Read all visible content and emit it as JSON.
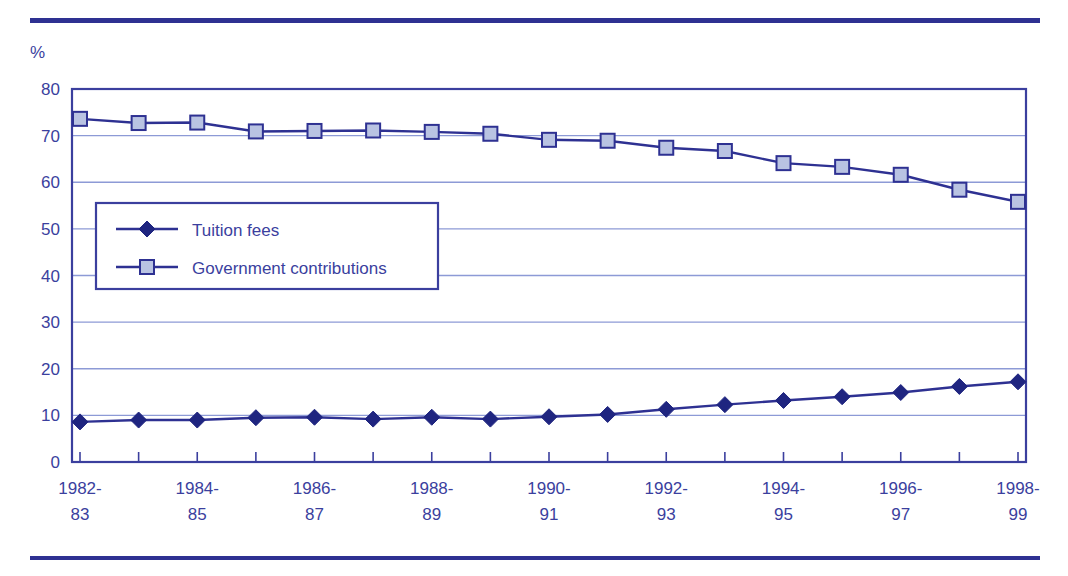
{
  "figure": {
    "y_axis_unit_label": "%",
    "colors": {
      "line": "#2e3192",
      "text": "#3b3f9e",
      "gridline": "#8d9ad6",
      "frame": "#3b3f9e",
      "rule": "#2e3192",
      "marker_square_fill": "#b9c3e2",
      "marker_diamond_fill": "#1f2580",
      "background": "#ffffff"
    }
  },
  "chart_data": {
    "type": "line",
    "title": "",
    "xlabel": "",
    "ylabel": "%",
    "ylim": [
      0,
      80
    ],
    "yticks": [
      0,
      10,
      20,
      30,
      40,
      50,
      60,
      70,
      80
    ],
    "grid": true,
    "legend_position": "inside-left",
    "categories": [
      "1982-83",
      "1983-84",
      "1984-85",
      "1985-86",
      "1986-87",
      "1987-88",
      "1988-89",
      "1989-90",
      "1990-91",
      "1991-92",
      "1992-93",
      "1993-94",
      "1994-95",
      "1995-96",
      "1996-97",
      "1997-98",
      "1998-99"
    ],
    "xtick_labels": [
      {
        "line1": "1982-",
        "line2": "83"
      },
      {
        "line1": "",
        "line2": ""
      },
      {
        "line1": "1984-",
        "line2": "85"
      },
      {
        "line1": "",
        "line2": ""
      },
      {
        "line1": "1986-",
        "line2": "87"
      },
      {
        "line1": "",
        "line2": ""
      },
      {
        "line1": "1988-",
        "line2": "89"
      },
      {
        "line1": "",
        "line2": ""
      },
      {
        "line1": "1990-",
        "line2": "91"
      },
      {
        "line1": "",
        "line2": ""
      },
      {
        "line1": "1992-",
        "line2": "93"
      },
      {
        "line1": "",
        "line2": ""
      },
      {
        "line1": "1994-",
        "line2": "95"
      },
      {
        "line1": "",
        "line2": ""
      },
      {
        "line1": "1996-",
        "line2": "97"
      },
      {
        "line1": "",
        "line2": ""
      },
      {
        "line1": "1998-",
        "line2": "99"
      }
    ],
    "series": [
      {
        "name": "Tuition fees",
        "marker": "diamond",
        "values": [
          8.6,
          9.0,
          9.0,
          9.5,
          9.6,
          9.2,
          9.6,
          9.2,
          9.7,
          10.2,
          11.3,
          12.3,
          13.2,
          14.0,
          14.9,
          16.2,
          17.2
        ]
      },
      {
        "name": "Government contributions",
        "marker": "square",
        "values": [
          73.6,
          72.7,
          72.8,
          70.9,
          71.0,
          71.1,
          70.8,
          70.4,
          69.1,
          68.9,
          67.4,
          66.7,
          64.1,
          63.3,
          61.6,
          58.4,
          55.8
        ]
      }
    ],
    "legend": [
      {
        "label": "Tuition fees",
        "marker": "diamond"
      },
      {
        "label": "Government contributions",
        "marker": "square"
      }
    ]
  }
}
